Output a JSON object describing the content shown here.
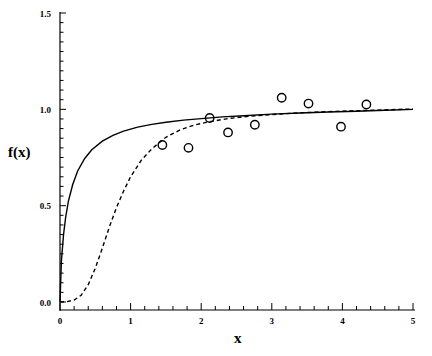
{
  "figure": {
    "ylabel": "f(x)",
    "xlabel": "x"
  },
  "chart_data": {
    "type": "scatter",
    "title": "",
    "xlabel": "x",
    "ylabel": "f(x)",
    "xlim": [
      0,
      5
    ],
    "ylim": [
      0.0,
      1.5
    ],
    "xticks": [
      0,
      1,
      2,
      3,
      4,
      5
    ],
    "xticklabels": [
      "0",
      "1",
      "2",
      "3",
      "4",
      "5"
    ],
    "yticks": [
      0.0,
      0.5,
      1.0,
      1.5
    ],
    "yticklabels": [
      "0.0",
      "0.5",
      "1.0",
      "1.5"
    ],
    "x_minor_tick_step": 0.2,
    "y_minor_tick_step": 0.05,
    "grid": false,
    "legend": null,
    "legend_position": "none",
    "series": [
      {
        "name": "observed",
        "type": "scatter",
        "marker": "open-circle",
        "color": "#000000",
        "points": [
          {
            "x": 1.45,
            "y": 0.815
          },
          {
            "x": 1.82,
            "y": 0.8
          },
          {
            "x": 2.12,
            "y": 0.955
          },
          {
            "x": 2.38,
            "y": 0.88
          },
          {
            "x": 2.76,
            "y": 0.92
          },
          {
            "x": 3.14,
            "y": 1.06
          },
          {
            "x": 3.52,
            "y": 1.03
          },
          {
            "x": 3.98,
            "y": 0.91
          },
          {
            "x": 4.34,
            "y": 1.025
          }
        ]
      },
      {
        "name": "solid-curve",
        "type": "line",
        "linestyle": "solid",
        "color": "#000000",
        "x": [
          0.0,
          0.02,
          0.05,
          0.08,
          0.12,
          0.18,
          0.25,
          0.35,
          0.45,
          0.6,
          0.75,
          0.9,
          1.1,
          1.3,
          1.5,
          1.75,
          2.0,
          2.3,
          2.6,
          3.0,
          3.4,
          3.8,
          4.2,
          4.6,
          5.0
        ],
        "y": [
          0.0,
          0.215,
          0.35,
          0.44,
          0.525,
          0.61,
          0.68,
          0.745,
          0.79,
          0.835,
          0.865,
          0.887,
          0.908,
          0.922,
          0.933,
          0.944,
          0.952,
          0.961,
          0.967,
          0.975,
          0.981,
          0.986,
          0.99,
          0.995,
          1.0
        ]
      },
      {
        "name": "dashed-curve",
        "type": "line",
        "linestyle": "dashed",
        "color": "#000000",
        "x": [
          0.0,
          0.1,
          0.2,
          0.3,
          0.4,
          0.5,
          0.6,
          0.7,
          0.8,
          0.9,
          1.0,
          1.15,
          1.3,
          1.5,
          1.7,
          1.9,
          2.1,
          2.4,
          2.7,
          3.0,
          3.4,
          3.8,
          4.2,
          4.6,
          5.0
        ],
        "y": [
          0.0,
          0.002,
          0.01,
          0.035,
          0.09,
          0.175,
          0.28,
          0.39,
          0.49,
          0.575,
          0.65,
          0.735,
          0.795,
          0.855,
          0.893,
          0.918,
          0.935,
          0.953,
          0.965,
          0.973,
          0.982,
          0.988,
          0.993,
          0.997,
          1.002
        ]
      }
    ]
  }
}
